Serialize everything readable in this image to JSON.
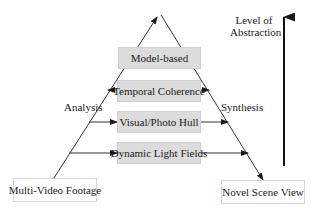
{
  "diagram": {
    "type": "pyramid-flow",
    "stages": [
      {
        "id": "model-based",
        "label": "Model-based"
      },
      {
        "id": "temporal-coherence",
        "label": "Temporal Coherence"
      },
      {
        "id": "visual-photo-hull",
        "label": "Visual/Photo Hull"
      },
      {
        "id": "dynamic-light-fields",
        "label": "Dynamic Light Fields"
      }
    ],
    "input": {
      "label": "Multi-Video Footage"
    },
    "output": {
      "label": "Novel Scene View"
    },
    "left_side_label": "Analysis",
    "right_side_label": "Synthesis",
    "axis": {
      "label_line1": "Level of",
      "label_line2": "Abstraction"
    },
    "colors": {
      "stage_fill": "#dcdcdc",
      "line": "#1a1a1a",
      "endpoint_fill": "#ffffff"
    }
  }
}
